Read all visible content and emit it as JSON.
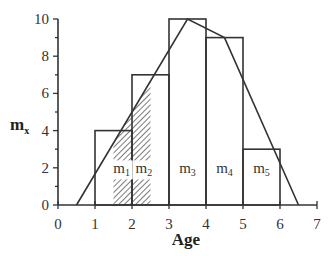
{
  "chart_data": {
    "type": "bar",
    "title": "",
    "xlabel": "Age",
    "ylabel": "m_x",
    "xlim": [
      0,
      7
    ],
    "ylim": [
      0,
      10
    ],
    "x_ticks": [
      0,
      1,
      2,
      3,
      4,
      5,
      6,
      7
    ],
    "y_ticks": [
      0,
      2,
      4,
      6,
      8,
      10
    ],
    "grid": false,
    "bars": [
      {
        "x0": 1,
        "x1": 2,
        "height": 4
      },
      {
        "x0": 2,
        "x1": 3,
        "height": 7
      },
      {
        "x0": 3,
        "x1": 4,
        "height": 10
      },
      {
        "x0": 4,
        "x1": 5,
        "height": 9
      },
      {
        "x0": 5,
        "x1": 6,
        "height": 3
      }
    ],
    "line": {
      "type": "line",
      "x": [
        0.5,
        3.5,
        4.5,
        6.5
      ],
      "y": [
        0,
        10,
        9,
        0
      ]
    },
    "hatched_region": {
      "x0": 1.5,
      "x1": 2.5,
      "description": "area under line between ages 1.5 and 2.5"
    },
    "annotations": [
      {
        "text": "m1",
        "base": "m",
        "sub": "1",
        "x": 1.72,
        "y": 1.7
      },
      {
        "text": "m2",
        "base": "m",
        "sub": "2",
        "x": 2.32,
        "y": 1.7
      },
      {
        "text": "m3",
        "base": "m",
        "sub": "3",
        "x": 3.5,
        "y": 1.7
      },
      {
        "text": "m4",
        "base": "m",
        "sub": "4",
        "x": 4.5,
        "y": 1.7
      },
      {
        "text": "m5",
        "base": "m",
        "sub": "5",
        "x": 5.5,
        "y": 1.7
      }
    ]
  },
  "axes": {
    "xlabel": "Age",
    "ylabel_base": "m",
    "ylabel_sub": "x"
  }
}
